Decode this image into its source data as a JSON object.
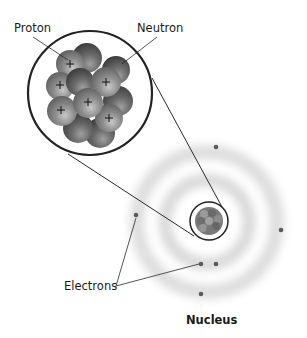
{
  "labels": {
    "proton": "Proton",
    "neutron": "Neutron",
    "electrons": "Electrons",
    "nucleus": "Nucleus"
  },
  "colors": {
    "proton": "#8a8a8a",
    "neutron": "#6e6e6e",
    "outline": "#2a2a2a",
    "electron": "#5a5a5a",
    "cloud": "#d0d0d0"
  },
  "particle_symbol": "+",
  "counts": {
    "protons_shown": 6,
    "electrons_shown": 6
  }
}
